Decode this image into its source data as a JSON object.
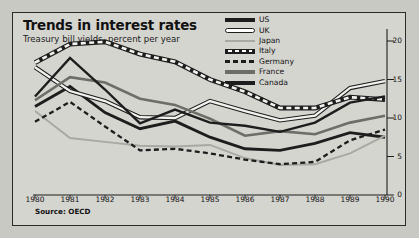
{
  "header": {
    "title": "Trends in interest rates",
    "subtitle": "Treasury bill yields, percent per year"
  },
  "source_note": "Source: OECD",
  "legend": {
    "items": [
      {
        "label": "US",
        "key": "k-us",
        "name": "legend-key-us"
      },
      {
        "label": "UK",
        "key": "k-uk",
        "name": "legend-key-uk"
      },
      {
        "label": "Japan",
        "key": "k-japan",
        "name": "legend-key-japan"
      },
      {
        "label": "Italy",
        "key": "k-italy",
        "name": "legend-key-italy"
      },
      {
        "label": "Germany",
        "key": "k-germany",
        "name": "legend-key-germany"
      },
      {
        "label": "France",
        "key": "k-france",
        "name": "legend-key-france"
      },
      {
        "label": "Canada",
        "key": "k-canada",
        "name": "legend-key-canada"
      }
    ]
  },
  "chart_data": {
    "type": "line",
    "title": "Trends in interest rates",
    "subtitle": "Treasury bill yields, percent per year",
    "xlabel": "",
    "ylabel": "percent per year",
    "ylim": [
      0,
      20
    ],
    "yticks": [
      0,
      5,
      10,
      15,
      20
    ],
    "y_axis_position": "right",
    "grid": false,
    "legend_position": "top-right",
    "x": [
      1980,
      1981,
      1982,
      1983,
      1984,
      1985,
      1986,
      1987,
      1988,
      1989,
      1990
    ],
    "xticks": [
      "1980",
      "1981",
      "1982",
      "1983",
      "1984",
      "1985",
      "1986",
      "1987",
      "1988",
      "1989",
      "1990"
    ],
    "series": [
      {
        "name": "US",
        "style": "solid-black-thick",
        "values": [
          11.5,
          14.1,
          10.7,
          8.6,
          9.6,
          7.5,
          6.0,
          5.8,
          6.7,
          8.1,
          7.5
        ]
      },
      {
        "name": "UK",
        "style": "outline-white",
        "values": [
          16.6,
          13.5,
          12.2,
          10.1,
          10.0,
          12.2,
          10.9,
          9.7,
          10.3,
          13.9,
          14.8
        ]
      },
      {
        "name": "Japan",
        "style": "solid-lightgray",
        "values": [
          10.9,
          7.4,
          6.9,
          6.4,
          6.3,
          6.5,
          4.8,
          3.9,
          4.0,
          5.4,
          7.7
        ]
      },
      {
        "name": "Italy",
        "style": "dashed-outline",
        "values": [
          17.2,
          19.6,
          19.9,
          18.3,
          17.3,
          15.0,
          13.4,
          11.3,
          11.3,
          12.7,
          12.4
        ]
      },
      {
        "name": "Germany",
        "style": "dashed-black",
        "values": [
          9.5,
          12.1,
          8.9,
          5.8,
          6.0,
          5.4,
          4.6,
          4.0,
          4.3,
          7.1,
          8.5
        ]
      },
      {
        "name": "France",
        "style": "solid-gray",
        "values": [
          12.3,
          15.3,
          14.6,
          12.5,
          11.7,
          9.9,
          7.7,
          8.3,
          7.9,
          9.4,
          10.3
        ]
      },
      {
        "name": "Canada",
        "style": "solid-black",
        "values": [
          12.8,
          17.8,
          13.7,
          9.3,
          11.1,
          9.4,
          9.0,
          8.2,
          9.4,
          12.0,
          12.8
        ]
      }
    ]
  }
}
